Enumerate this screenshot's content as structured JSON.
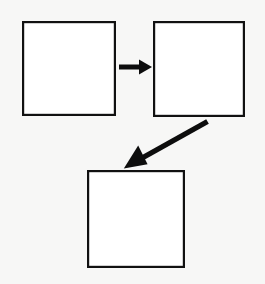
{
  "canvas": {
    "width": 265,
    "height": 284,
    "background_color": "#f7f7f6",
    "title": ""
  },
  "style": {
    "node_fill": "#ffffff",
    "node_stroke": "#111111",
    "node_stroke_width": 2.2,
    "connector_color": "#0d0d0d",
    "connector_width": 5
  },
  "diagram": {
    "type": "flowchart",
    "orientation": "mixed",
    "nodes": [
      {
        "id": "box-1",
        "shape": "rectangle",
        "label": "",
        "x": 22,
        "y": 21,
        "width": 94,
        "height": 95
      },
      {
        "id": "box-2",
        "shape": "rectangle",
        "label": "",
        "x": 153,
        "y": 21,
        "width": 92,
        "height": 96
      },
      {
        "id": "box-3",
        "shape": "rectangle",
        "label": "",
        "x": 87,
        "y": 170,
        "width": 98,
        "height": 98
      }
    ],
    "edges": [
      {
        "id": "edge-1",
        "from": "box-1",
        "to": "box-2",
        "label": "",
        "direction": "right",
        "shaft_start_x": 119,
        "shaft_start_y": 67,
        "shaft_end_x": 140,
        "shaft_end_y": 67,
        "tip_x": 152,
        "tip_y": 67,
        "head_half_width": 7
      },
      {
        "id": "edge-2",
        "from": "box-2",
        "to": "box-3",
        "label": "",
        "direction": "down-left",
        "shaft_start_x": 207,
        "shaft_start_y": 122,
        "shaft_end_x": 144,
        "shaft_end_y": 157,
        "tip_x": 124,
        "tip_y": 168,
        "head_half_width": 9
      }
    ]
  }
}
